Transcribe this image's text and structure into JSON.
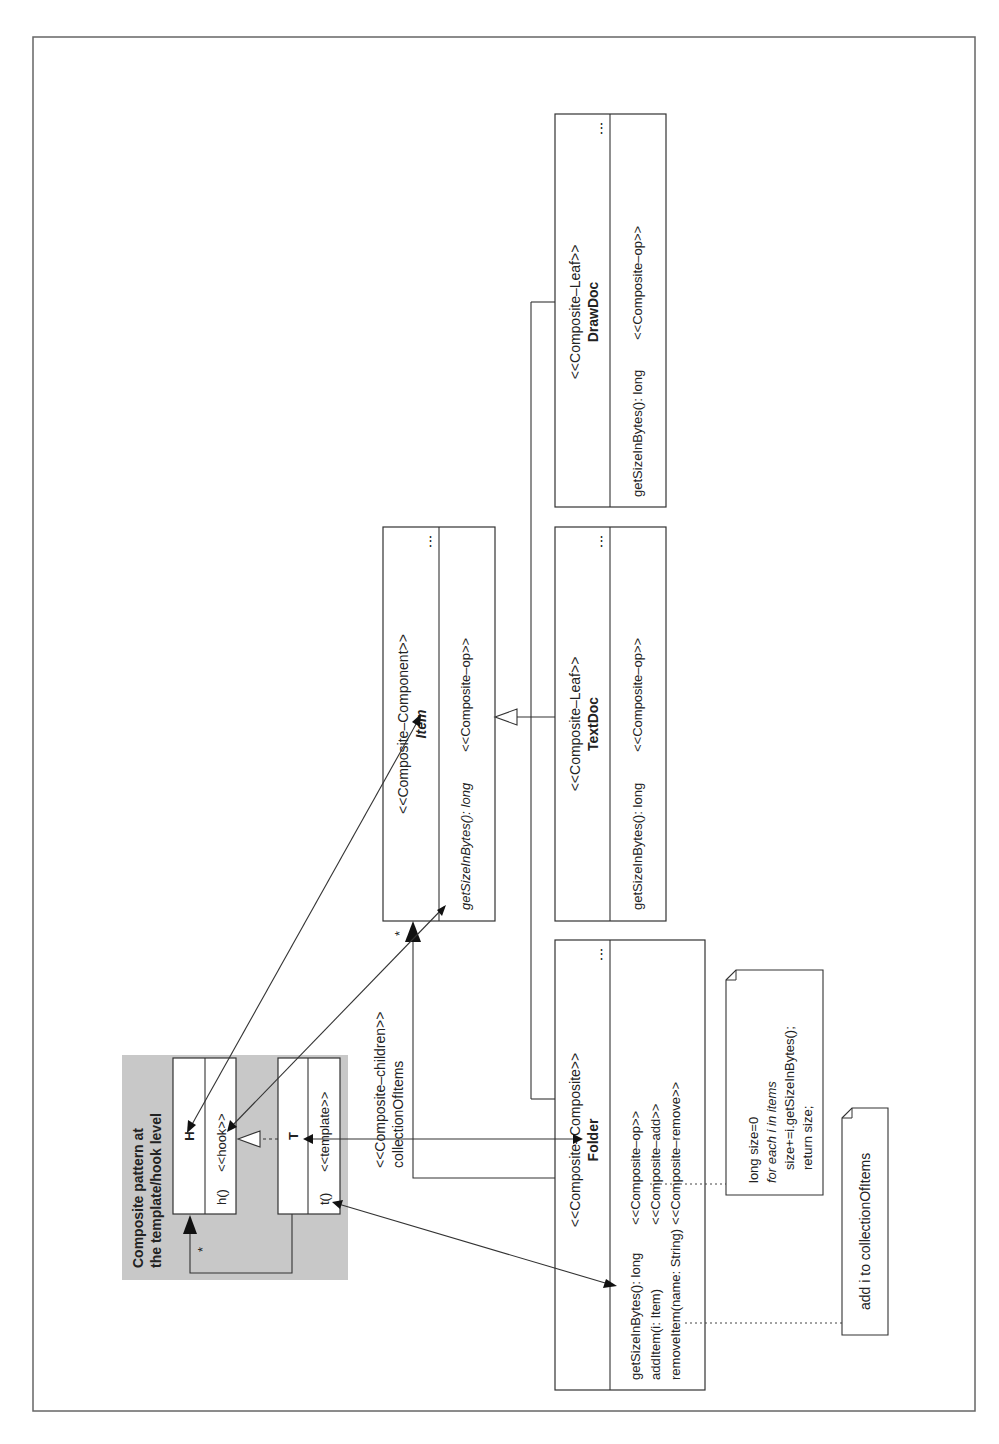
{
  "diagram": {
    "title_panel": {
      "line1": "Composite pattern at",
      "line2": "the template/hook level",
      "hook_class": {
        "name": "H",
        "method": "h()",
        "stereotype": "<<hook>>"
      },
      "template_class": {
        "name": "T",
        "method": "t()",
        "stereotype": "<<template>>"
      },
      "multiplicity": "*"
    },
    "classes": {
      "item": {
        "stereotype": "<<Composite–Component>>",
        "name": "Item",
        "ellipsis": "⋮",
        "operation": "getSizeInBytes(): long",
        "operation_stereotype": "<<Composite–op>>"
      },
      "folder": {
        "stereotype": "<<Composite–Composite>>",
        "name": "Folder",
        "ellipsis": "⋮",
        "operations": [
          {
            "sig": "getSizeInBytes(): long",
            "stereotype": "<<Composite–op>>"
          },
          {
            "sig": "addItem(i: Item)",
            "stereotype": "<<Composite–add>>"
          },
          {
            "sig": "removeItem(name: String)",
            "stereotype": "<<Composite–remove>>"
          }
        ]
      },
      "textdoc": {
        "stereotype": "<<Composite–Leaf>>",
        "name": "TextDoc",
        "ellipsis": "⋮",
        "operation": "getSizeInBytes(): long",
        "operation_stereotype": "<<Composite–op>>"
      },
      "drawdoc": {
        "stereotype": "<<Composite–Leaf>>",
        "name": "DrawDoc",
        "ellipsis": "⋮",
        "operation": "getSizeInBytes(): long",
        "operation_stereotype": "<<Composite–op>>"
      }
    },
    "association": {
      "stereotype": "<<Composite–children>>",
      "role": "collectionOfItems",
      "multiplicity": "*"
    },
    "notes": {
      "size_note": {
        "line1": "long size=0",
        "line2": "for each i in items",
        "line3": "size+=i.getSizeInBytes();",
        "line4": "return size;"
      },
      "add_note": {
        "text": "add i to collectionOfItems"
      }
    }
  }
}
